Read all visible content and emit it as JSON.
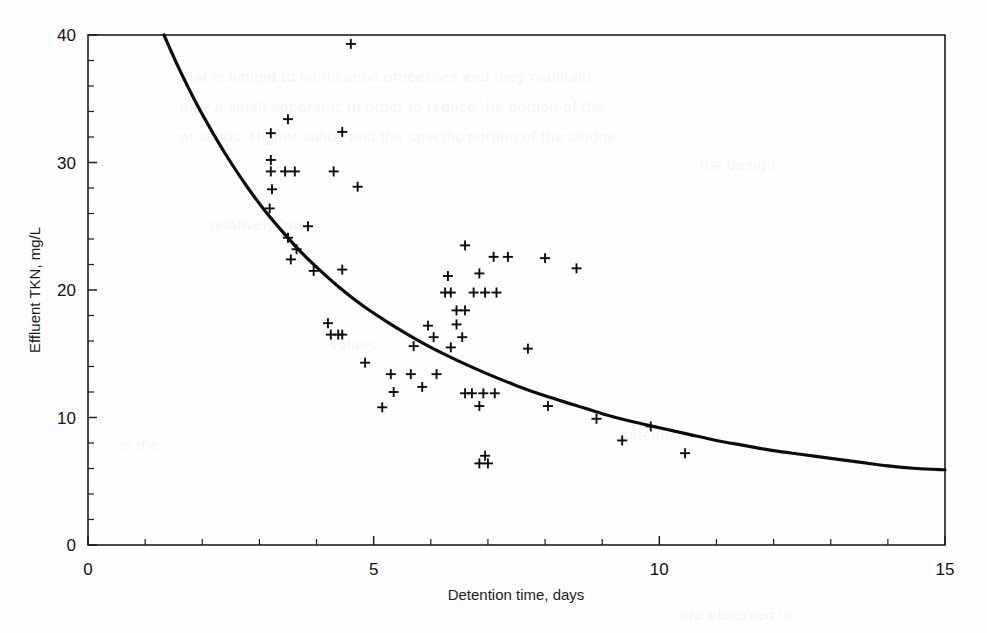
{
  "chart_data": {
    "type": "scatter",
    "title": "",
    "xlabel": "Detention time, days",
    "ylabel": "Effluent TKN, mg/L",
    "xlim": [
      0,
      15
    ],
    "ylim": [
      0,
      40
    ],
    "x_ticks": [
      0,
      5,
      10,
      15
    ],
    "y_ticks": [
      0,
      10,
      20,
      30,
      40
    ],
    "x_tick_labels": [
      "0",
      "5",
      "10",
      "15"
    ],
    "y_tick_labels": [
      "0",
      "10",
      "20",
      "30",
      "40"
    ],
    "x_minor_step": 1,
    "y_minor_step": 2,
    "grid": false,
    "legend": "none",
    "marker_symbol": "plus",
    "series": [
      {
        "name": "Effluent TKN observations",
        "marker": "plus",
        "points": [
          [
            4.6,
            39.3
          ],
          [
            3.5,
            33.4
          ],
          [
            3.2,
            32.3
          ],
          [
            4.45,
            32.4
          ],
          [
            3.2,
            30.2
          ],
          [
            3.2,
            29.3
          ],
          [
            3.45,
            29.3
          ],
          [
            3.62,
            29.3
          ],
          [
            4.3,
            29.3
          ],
          [
            3.22,
            27.9
          ],
          [
            4.72,
            28.1
          ],
          [
            3.18,
            26.4
          ],
          [
            3.85,
            25.0
          ],
          [
            3.5,
            24.1
          ],
          [
            3.65,
            23.2
          ],
          [
            3.55,
            22.4
          ],
          [
            3.95,
            21.5
          ],
          [
            4.45,
            21.6
          ],
          [
            6.6,
            23.5
          ],
          [
            7.1,
            22.6
          ],
          [
            7.35,
            22.6
          ],
          [
            8.0,
            22.5
          ],
          [
            8.55,
            21.7
          ],
          [
            6.3,
            21.1
          ],
          [
            6.85,
            21.3
          ],
          [
            6.25,
            19.8
          ],
          [
            6.35,
            19.8
          ],
          [
            6.75,
            19.8
          ],
          [
            6.95,
            19.8
          ],
          [
            7.15,
            19.8
          ],
          [
            6.45,
            18.4
          ],
          [
            6.6,
            18.4
          ],
          [
            4.25,
            16.5
          ],
          [
            4.38,
            16.5
          ],
          [
            4.45,
            16.5
          ],
          [
            4.2,
            17.4
          ],
          [
            5.95,
            17.2
          ],
          [
            6.45,
            17.3
          ],
          [
            6.05,
            16.3
          ],
          [
            6.55,
            16.3
          ],
          [
            5.7,
            15.6
          ],
          [
            6.35,
            15.5
          ],
          [
            7.7,
            15.4
          ],
          [
            4.85,
            14.3
          ],
          [
            5.3,
            13.4
          ],
          [
            5.65,
            13.4
          ],
          [
            6.1,
            13.4
          ],
          [
            5.85,
            12.4
          ],
          [
            5.35,
            12.0
          ],
          [
            6.6,
            11.9
          ],
          [
            6.72,
            11.9
          ],
          [
            6.92,
            11.9
          ],
          [
            7.12,
            11.9
          ],
          [
            5.15,
            10.8
          ],
          [
            6.85,
            10.9
          ],
          [
            8.05,
            10.9
          ],
          [
            8.9,
            9.9
          ],
          [
            9.35,
            8.2
          ],
          [
            9.85,
            9.3
          ],
          [
            10.45,
            7.2
          ],
          [
            6.95,
            7.0
          ],
          [
            6.85,
            6.4
          ],
          [
            7.0,
            6.4
          ]
        ]
      }
    ],
    "fit_curve": {
      "name": "fitted decay curve",
      "points": [
        [
          1.33,
          40.0
        ],
        [
          1.6,
          37.3
        ],
        [
          1.9,
          34.6
        ],
        [
          2.2,
          32.2
        ],
        [
          2.5,
          30.0
        ],
        [
          2.8,
          28.0
        ],
        [
          3.1,
          26.2
        ],
        [
          3.4,
          24.6
        ],
        [
          3.7,
          23.1
        ],
        [
          4.0,
          21.8
        ],
        [
          4.4,
          20.2
        ],
        [
          4.8,
          18.8
        ],
        [
          5.2,
          17.6
        ],
        [
          5.6,
          16.5
        ],
        [
          6.0,
          15.5
        ],
        [
          6.5,
          14.4
        ],
        [
          7.0,
          13.4
        ],
        [
          7.5,
          12.5
        ],
        [
          8.0,
          11.7
        ],
        [
          8.5,
          11.0
        ],
        [
          9.0,
          10.3
        ],
        [
          9.5,
          9.7
        ],
        [
          10.0,
          9.2
        ],
        [
          10.5,
          8.7
        ],
        [
          11.0,
          8.2
        ],
        [
          11.5,
          7.8
        ],
        [
          12.0,
          7.4
        ],
        [
          12.5,
          7.1
        ],
        [
          13.0,
          6.8
        ],
        [
          13.5,
          6.5
        ],
        [
          14.0,
          6.2
        ],
        [
          14.5,
          6.0
        ],
        [
          15.0,
          5.9
        ]
      ]
    }
  },
  "ghost_lines": [
    {
      "x": 180,
      "y": 62,
      "text": "that is limited to nitrification processes and they maintain"
    },
    {
      "x": 180,
      "y": 92,
      "text": "only a small   apparatus   in order to reduce the portion of the"
    },
    {
      "x": 180,
      "y": 122,
      "text": "of solids. Higher  solids   and the specific  portion of the sludge"
    },
    {
      "x": 210,
      "y": 210,
      "text": "relatively low"
    },
    {
      "x": 700,
      "y": 150,
      "text": "the design"
    },
    {
      "x": 330,
      "y": 330,
      "text": "values"
    },
    {
      "x": 120,
      "y": 430,
      "text": "is the"
    },
    {
      "x": 620,
      "y": 420,
      "text": "detention"
    },
    {
      "x": 680,
      "y": 600,
      "text": "are observed in"
    }
  ]
}
